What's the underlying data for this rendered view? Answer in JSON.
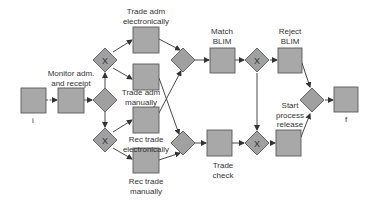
{
  "diagram": {
    "type": "process-flow",
    "colors": {
      "node_fill": "#a8a8a8",
      "node_stroke": "#5a5a5a",
      "edge": "#333333",
      "text": "#333333"
    },
    "gateway_marker": "X",
    "nodes": [
      {
        "id": "i",
        "kind": "task",
        "label": "i"
      },
      {
        "id": "monitor",
        "kind": "task",
        "label": "Monitor adm.\nand receipt"
      },
      {
        "id": "g_split",
        "kind": "gateway",
        "marker": ""
      },
      {
        "id": "g_x_adm",
        "kind": "gateway",
        "marker": "X"
      },
      {
        "id": "g_x_rec",
        "kind": "gateway",
        "marker": "X"
      },
      {
        "id": "adm_elec",
        "kind": "task",
        "label": "Trade adm\nelectronically"
      },
      {
        "id": "adm_man",
        "kind": "task",
        "label": "Trade adm\nmanually"
      },
      {
        "id": "rec_elec",
        "kind": "task",
        "label": "Rec trade\nelectronically"
      },
      {
        "id": "rec_man",
        "kind": "task",
        "label": "Rec trade\nmanually"
      },
      {
        "id": "g_join_top",
        "kind": "gateway",
        "marker": ""
      },
      {
        "id": "g_join_bot",
        "kind": "gateway",
        "marker": ""
      },
      {
        "id": "match_blim",
        "kind": "task",
        "label": "Match\nBLIM"
      },
      {
        "id": "trade_check",
        "kind": "task",
        "label": "Trade\ncheck"
      },
      {
        "id": "g_x_match",
        "kind": "gateway",
        "marker": "X"
      },
      {
        "id": "g_x_check",
        "kind": "gateway",
        "marker": "X"
      },
      {
        "id": "reject_blim",
        "kind": "task",
        "label": "Reject\nBLIM"
      },
      {
        "id": "start_release",
        "kind": "task",
        "label": "Start\nprocess\nrelease"
      },
      {
        "id": "g_final",
        "kind": "gateway",
        "marker": ""
      },
      {
        "id": "f",
        "kind": "task",
        "label": "f"
      }
    ],
    "edges": [
      [
        "i",
        "monitor"
      ],
      [
        "monitor",
        "g_split"
      ],
      [
        "g_split",
        "g_x_adm"
      ],
      [
        "g_split",
        "g_x_rec"
      ],
      [
        "g_x_adm",
        "adm_elec"
      ],
      [
        "g_x_adm",
        "adm_man"
      ],
      [
        "g_x_rec",
        "rec_elec"
      ],
      [
        "g_x_rec",
        "rec_man"
      ],
      [
        "adm_elec",
        "g_join_top"
      ],
      [
        "adm_man",
        "g_join_bot"
      ],
      [
        "rec_elec",
        "g_join_top"
      ],
      [
        "rec_man",
        "g_join_bot"
      ],
      [
        "g_join_top",
        "match_blim"
      ],
      [
        "g_join_bot",
        "trade_check"
      ],
      [
        "match_blim",
        "g_x_match"
      ],
      [
        "trade_check",
        "g_x_check"
      ],
      [
        "g_x_match",
        "reject_blim"
      ],
      [
        "g_x_match",
        "g_x_check"
      ],
      [
        "g_x_check",
        "start_release"
      ],
      [
        "reject_blim",
        "g_final"
      ],
      [
        "start_release",
        "g_final"
      ],
      [
        "g_final",
        "f"
      ]
    ]
  },
  "labels": {
    "i": "i",
    "monitor_1": "Monitor adm.",
    "monitor_2": "and receipt",
    "adm_elec_1": "Trade adm",
    "adm_elec_2": "electronically",
    "adm_man_1": "Trade adm",
    "adm_man_2": "manually",
    "rec_elec_1": "Rec trade",
    "rec_elec_2": "electronically",
    "rec_man_1": "Rec trade",
    "rec_man_2": "manually",
    "match_1": "Match",
    "match_2": "BLIM",
    "check_1": "Trade",
    "check_2": "check",
    "reject_1": "Reject",
    "reject_2": "BLIM",
    "release_1": "Start",
    "release_2": "process",
    "release_3": "release",
    "f": "f",
    "x_marker": "X"
  }
}
